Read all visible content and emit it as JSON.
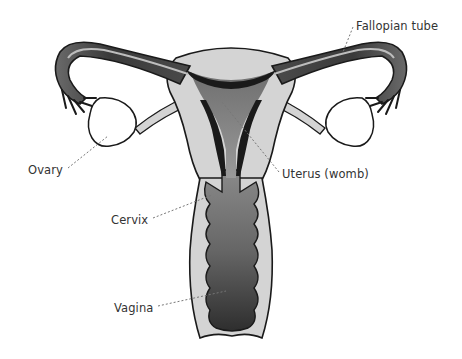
{
  "diagram": {
    "labels": {
      "fallopian_tube": "Fallopian tube",
      "ovary": "Ovary",
      "uterus": "Uterus (womb)",
      "cervix": "Cervix",
      "vagina": "Vagina"
    },
    "colors": {
      "outline": "#1a1a1a",
      "light_tissue": "#d4d4d4",
      "mid_tissue": "#8a8a8a",
      "dark_tissue": "#3a3a3a",
      "ovary_fill": "#ffffff",
      "leader_line": "#777777"
    }
  }
}
